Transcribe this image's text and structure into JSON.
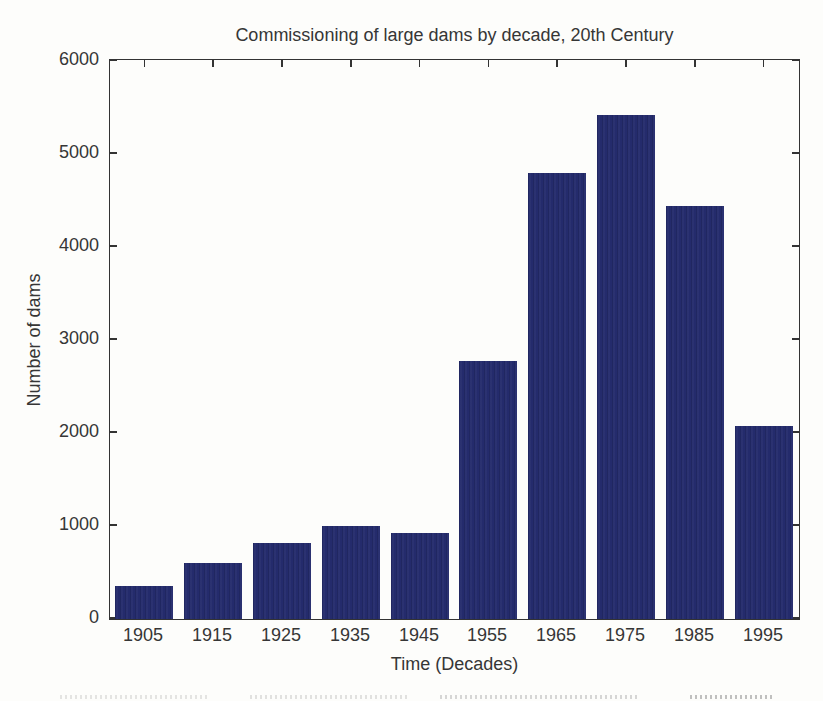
{
  "chart_data": {
    "type": "bar",
    "title": "Commissioning of large dams by decade, 20th Century",
    "xlabel": "Time (Decades)",
    "ylabel": "Number of dams",
    "categories": [
      "1905",
      "1915",
      "1925",
      "1935",
      "1945",
      "1955",
      "1965",
      "1975",
      "1985",
      "1995"
    ],
    "values": [
      360,
      600,
      820,
      1000,
      925,
      2775,
      4800,
      5420,
      4445,
      2070
    ],
    "ylim": [
      0,
      6000
    ],
    "yticks": [
      0,
      1000,
      2000,
      3000,
      4000,
      5000,
      6000
    ],
    "ytick_labels": [
      "0",
      "1000",
      "2000",
      "3000",
      "4000",
      "5000",
      "6000"
    ],
    "grid": false,
    "legend": "none",
    "bar_color": "#242b6c",
    "axis_color": "#333333",
    "text_color": "#363636",
    "background_color": "#fdfdfb"
  }
}
